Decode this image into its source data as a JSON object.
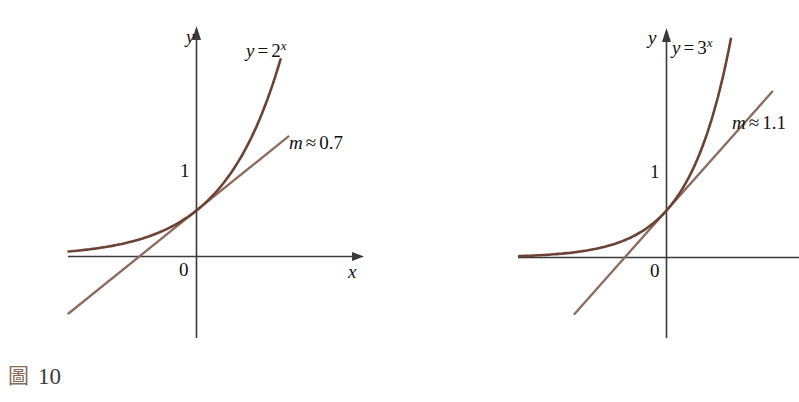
{
  "page": {
    "background": "#ffffff",
    "width": 799,
    "height": 402
  },
  "colors": {
    "curve": "#6b4233",
    "tangent": "#8c6a5d",
    "axis": "#3a3a3a",
    "text": "#111111",
    "caption_glyph": "#8a6a56",
    "caption_number": "#3b3b3b"
  },
  "figures": [
    {
      "id": "figure-10",
      "caption_glyph": "圖",
      "caption_glyph_name": "figure-icon",
      "caption_number": "10",
      "axis_labels": {
        "x": "x",
        "y": "y"
      },
      "tick_labels": {
        "y_one": "1",
        "origin": "0"
      },
      "curve_label": {
        "lhs": "y",
        "eq": "=",
        "base": "2",
        "exponent": "x"
      },
      "curve_label_text": "y = 2^x",
      "tangent_label": {
        "symbol": "m",
        "relation": "≈",
        "value": "0.7"
      },
      "tangent_label_text": "m ≈ 0.7"
    },
    {
      "id": "figure-11",
      "caption_glyph": "圖",
      "caption_glyph_name": "figure-icon",
      "caption_number": "11",
      "axis_labels": {
        "x": "",
        "y": "y"
      },
      "tick_labels": {
        "y_one": "1",
        "origin": "0"
      },
      "curve_label": {
        "lhs": "y",
        "eq": "=",
        "base": "3",
        "exponent": "x"
      },
      "curve_label_text": "y = 3^x",
      "tangent_label": {
        "symbol": "m",
        "relation": "≈",
        "value": "1.1"
      },
      "tangent_label_text": "m ≈ 1.1"
    }
  ],
  "chart_data": [
    {
      "type": "line",
      "title": "y = 2^x with tangent at (0, 1)",
      "xlabel": "x",
      "ylabel": "y",
      "xlim": [
        -3.2,
        2.3
      ],
      "ylim": [
        -1.6,
        4.6
      ],
      "grid": false,
      "legend": "none",
      "series": [
        {
          "name": "y = 2^x",
          "kind": "exponential",
          "base": 2,
          "color": "#6b4233",
          "x": [
            -3.2,
            -2.8,
            -2.4,
            -2.0,
            -1.6,
            -1.2,
            -0.8,
            -0.4,
            0.0,
            0.4,
            0.8,
            1.2,
            1.6,
            2.0,
            2.1
          ],
          "y": [
            0.109,
            0.144,
            0.189,
            0.25,
            0.33,
            0.435,
            0.574,
            0.758,
            1.0,
            1.32,
            1.741,
            2.297,
            3.031,
            4.0,
            4.29
          ]
        },
        {
          "name": "tangent m ≈ 0.7",
          "kind": "line",
          "slope": 0.7,
          "intercept": 1.0,
          "color": "#8c6a5d",
          "x": [
            -3.2,
            2.3
          ],
          "y": [
            -1.24,
            2.61
          ]
        }
      ],
      "annotations": [
        {
          "text": "y = 2^x",
          "x": 0.35,
          "y": 4.3
        },
        {
          "text": "m ≈ 0.7",
          "x": 1.05,
          "y": 2.2
        },
        {
          "text": "1",
          "x": -0.22,
          "y": 1.0
        },
        {
          "text": "0",
          "x": -0.2,
          "y": -0.3
        }
      ]
    },
    {
      "type": "line",
      "title": "y = 3^x with tangent at (0, 1)",
      "xlabel": "",
      "ylabel": "y",
      "xlim": [
        -3.2,
        2.3
      ],
      "ylim": [
        -2.2,
        4.6
      ],
      "grid": false,
      "legend": "none",
      "series": [
        {
          "name": "y = 3^x",
          "kind": "exponential",
          "base": 3,
          "color": "#6b4233",
          "x": [
            -3.2,
            -2.8,
            -2.4,
            -2.0,
            -1.6,
            -1.2,
            -0.8,
            -0.4,
            0.0,
            0.4,
            0.8,
            1.2,
            1.4
          ],
          "y": [
            0.028,
            0.042,
            0.064,
            0.111,
            0.174,
            0.268,
            0.415,
            0.643,
            1.0,
            1.552,
            2.408,
            3.737,
            4.656
          ]
        },
        {
          "name": "tangent m ≈ 1.1",
          "kind": "line",
          "slope": 1.1,
          "intercept": 1.0,
          "color": "#8c6a5d",
          "x": [
            -2.0,
            2.3
          ],
          "y": [
            -1.2,
            3.53
          ]
        }
      ],
      "annotations": [
        {
          "text": "y = 3^x",
          "x": 0.1,
          "y": 4.3
        },
        {
          "text": "m ≈ 1.1",
          "x": 1.1,
          "y": 2.45
        },
        {
          "text": "1",
          "x": -0.22,
          "y": 1.0
        },
        {
          "text": "0",
          "x": -0.2,
          "y": -0.35
        }
      ]
    }
  ]
}
